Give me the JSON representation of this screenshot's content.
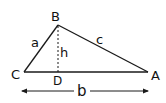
{
  "diagram": {
    "type": "triangle-with-altitude",
    "vertices": {
      "A": {
        "label": "A",
        "x": 148,
        "y": 72
      },
      "B": {
        "label": "B",
        "x": 58,
        "y": 25
      },
      "C": {
        "label": "C",
        "x": 24,
        "y": 72
      },
      "D": {
        "label": "D",
        "x": 58,
        "y": 72
      }
    },
    "sides": {
      "a": {
        "label": "a",
        "from": "C",
        "to": "B"
      },
      "b": {
        "label": "b",
        "from": "C",
        "to": "A"
      },
      "c": {
        "label": "c",
        "from": "B",
        "to": "A"
      }
    },
    "altitude": {
      "label": "h",
      "from": "B",
      "to": "D",
      "style": "dashed"
    },
    "dimension_arrow": {
      "label": "b",
      "x1": 22,
      "x2": 148,
      "y": 91
    },
    "colors": {
      "stroke": "#1a1a1a",
      "background": "#ffffff"
    }
  }
}
